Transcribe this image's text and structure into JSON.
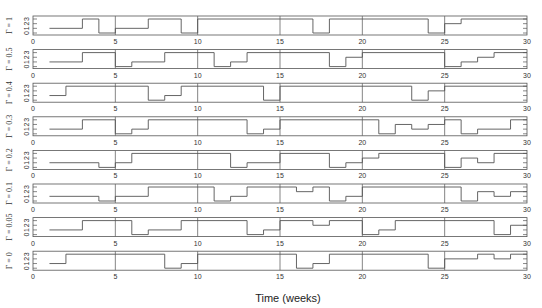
{
  "chart_data": {
    "type": "line",
    "step": true,
    "title": "",
    "xlabel": "Time (weeks)",
    "ylabel": "",
    "xlim": [
      0,
      30
    ],
    "ylim": [
      0,
      3
    ],
    "xticks": [
      0,
      5,
      10,
      15,
      20,
      25,
      30
    ],
    "yticks": [
      0,
      1,
      2,
      3
    ],
    "grid": "vertical lines at x ticks",
    "line_color": "#555555",
    "panels": [
      {
        "label": "Γ = 1",
        "steps": [
          [
            1,
            1
          ],
          [
            3,
            3
          ],
          [
            4,
            0
          ],
          [
            5,
            1
          ],
          [
            7,
            3
          ],
          [
            9,
            0
          ],
          [
            10,
            3
          ],
          [
            17,
            0
          ],
          [
            18,
            3
          ],
          [
            24,
            0
          ],
          [
            25,
            2
          ],
          [
            26,
            3
          ],
          [
            30,
            3
          ]
        ]
      },
      {
        "label": "Γ = 0.5",
        "steps": [
          [
            1,
            1
          ],
          [
            3,
            3
          ],
          [
            5,
            0
          ],
          [
            6,
            1
          ],
          [
            8,
            3
          ],
          [
            11,
            0
          ],
          [
            12,
            1
          ],
          [
            13,
            3
          ],
          [
            18,
            0
          ],
          [
            19,
            2
          ],
          [
            20,
            3
          ],
          [
            25,
            0
          ],
          [
            26,
            1
          ],
          [
            27,
            2
          ],
          [
            28,
            3
          ],
          [
            30,
            3
          ]
        ]
      },
      {
        "label": "Γ = 0.4",
        "steps": [
          [
            1,
            1
          ],
          [
            2,
            3
          ],
          [
            7,
            0
          ],
          [
            8,
            1
          ],
          [
            9,
            3
          ],
          [
            14,
            0
          ],
          [
            15,
            3
          ],
          [
            23,
            0
          ],
          [
            24,
            2
          ],
          [
            25,
            3
          ],
          [
            30,
            3
          ]
        ]
      },
      {
        "label": "Γ = 0.3",
        "steps": [
          [
            1,
            1
          ],
          [
            3,
            3
          ],
          [
            5,
            0
          ],
          [
            6,
            1
          ],
          [
            7,
            3
          ],
          [
            13,
            0
          ],
          [
            14,
            1
          ],
          [
            15,
            3
          ],
          [
            21,
            0
          ],
          [
            22,
            2
          ],
          [
            23,
            1
          ],
          [
            24,
            2
          ],
          [
            25,
            3
          ],
          [
            26,
            0
          ],
          [
            27,
            1
          ],
          [
            29,
            3
          ],
          [
            30,
            3
          ]
        ]
      },
      {
        "label": "Γ = 0.2",
        "steps": [
          [
            1,
            1
          ],
          [
            4,
            0
          ],
          [
            5,
            1
          ],
          [
            6,
            3
          ],
          [
            12,
            0
          ],
          [
            13,
            1
          ],
          [
            15,
            3
          ],
          [
            18,
            0
          ],
          [
            19,
            1
          ],
          [
            20,
            2
          ],
          [
            21,
            3
          ],
          [
            25,
            0
          ],
          [
            26,
            2
          ],
          [
            27,
            1
          ],
          [
            28,
            3
          ],
          [
            30,
            3
          ]
        ]
      },
      {
        "label": "Γ = 0.1",
        "steps": [
          [
            1,
            1
          ],
          [
            4,
            0
          ],
          [
            5,
            1
          ],
          [
            7,
            3
          ],
          [
            11,
            0
          ],
          [
            12,
            1
          ],
          [
            13,
            3
          ],
          [
            16,
            2
          ],
          [
            17,
            3
          ],
          [
            18,
            0
          ],
          [
            19,
            1
          ],
          [
            20,
            3
          ],
          [
            26,
            0
          ],
          [
            27,
            2
          ],
          [
            28,
            1
          ],
          [
            29,
            2
          ],
          [
            30,
            2
          ]
        ]
      },
      {
        "label": "Γ = 0.05",
        "steps": [
          [
            1,
            1
          ],
          [
            3,
            3
          ],
          [
            6,
            0
          ],
          [
            7,
            1
          ],
          [
            9,
            3
          ],
          [
            13,
            0
          ],
          [
            14,
            1
          ],
          [
            15,
            3
          ],
          [
            17,
            2
          ],
          [
            18,
            3
          ],
          [
            20,
            0
          ],
          [
            21,
            1
          ],
          [
            22,
            3
          ],
          [
            28,
            0
          ],
          [
            29,
            2
          ],
          [
            30,
            2
          ]
        ]
      },
      {
        "label": "Γ = 0",
        "steps": [
          [
            1,
            1
          ],
          [
            2,
            3
          ],
          [
            8,
            0
          ],
          [
            9,
            1
          ],
          [
            10,
            3
          ],
          [
            16,
            0
          ],
          [
            17,
            1
          ],
          [
            18,
            3
          ],
          [
            24,
            0
          ],
          [
            25,
            2
          ],
          [
            27,
            3
          ],
          [
            28,
            2
          ],
          [
            29,
            3
          ],
          [
            30,
            3
          ]
        ]
      }
    ]
  }
}
